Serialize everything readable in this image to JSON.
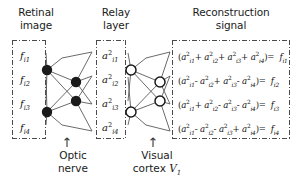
{
  "headers": {
    "retinal": "Retinal\nimage",
    "retinal_line1": "Retinal",
    "retinal_line2": "image",
    "relay_line1": "Relay",
    "relay_line2": "layer",
    "recon_line1": "Reconstruction",
    "recon_line2": "signal"
  },
  "retinal_inputs": [
    {
      "base": "f",
      "sub": "i1",
      "text": "f i1"
    },
    {
      "base": "f",
      "sub": "i2",
      "text": "f i2"
    },
    {
      "base": "f",
      "sub": "i3",
      "text": "f i3"
    },
    {
      "base": "f",
      "sub": "i4",
      "text": "f i4"
    }
  ],
  "relay_nodes": [
    {
      "base": "a",
      "sup": "2",
      "sub": "i1"
    },
    {
      "base": "a",
      "sup": "2",
      "sub": "i2"
    },
    {
      "base": "a",
      "sup": "2",
      "sub": "i3"
    },
    {
      "base": "a",
      "sup": "2",
      "sub": "i4"
    }
  ],
  "equations": [
    {
      "signs": [
        "+",
        "+",
        "+"
      ],
      "result_sub": "i1",
      "plain": "(a2i1 + a2i2 + a2i3 + a2i4) = f i1"
    },
    {
      "signs": [
        "-",
        "+",
        "-"
      ],
      "result_sub": "i2",
      "plain": "(a2i1 - a2i2 + a2i3 - a2i4) = f i2"
    },
    {
      "signs": [
        "+",
        "-",
        "-"
      ],
      "result_sub": "i3",
      "plain": "(a2i1 + a2i2 - a2i3 - a2i4) = f i3"
    },
    {
      "signs": [
        "-",
        "-",
        "+"
      ],
      "result_sub": "i4",
      "plain": "(a2i1 - a2i2 - a2i3 + a2i4) = f i4"
    }
  ],
  "footers": {
    "optic_line1": "Optic",
    "optic_line2": "nerve",
    "visual_line1": "Visual",
    "visual_line2_prefix": "cortex ",
    "visual_cortex_symbol": "V",
    "visual_cortex_sub": "1",
    "arrow_glyph": "↑"
  },
  "colors": {
    "node_filled": "#1a1a1a",
    "node_open_fill": "#ffffff",
    "node_stroke": "#1a1a1a",
    "edge": "#5a5a5a",
    "box_border": "#4a4a4a",
    "text": "#1b1b1b"
  },
  "stage1_nodes": [
    {
      "cx": 47,
      "cy": 70,
      "style": "filled"
    },
    {
      "cx": 47,
      "cy": 112,
      "style": "filled"
    },
    {
      "cx": 76,
      "cy": 82,
      "style": "filled"
    },
    {
      "cx": 76,
      "cy": 101,
      "style": "filled"
    }
  ],
  "stage2_nodes": [
    {
      "cx": 131,
      "cy": 70,
      "style": "open"
    },
    {
      "cx": 131,
      "cy": 112,
      "style": "open"
    },
    {
      "cx": 160,
      "cy": 82,
      "style": "open"
    },
    {
      "cx": 160,
      "cy": 101,
      "style": "open"
    }
  ]
}
